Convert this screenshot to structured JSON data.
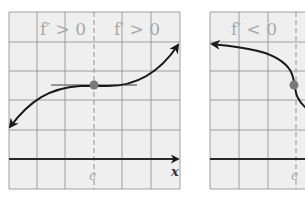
{
  "panels": [
    {
      "id": "left",
      "region_labels": [
        "f′ > 0",
        "f′ > 0"
      ],
      "tick_label": "c",
      "axis_label": "x",
      "curve": "increasing with horizontal tangent at c (inflection)",
      "point": "(c, f(c))"
    },
    {
      "id": "right",
      "region_labels": [
        "f′ < 0"
      ],
      "tick_label": "c",
      "curve": "decreasing with vertical tangent at c",
      "point": "(c, f(c))"
    }
  ],
  "colors": {
    "panel_bg": "#efefef",
    "grid": "#8a8a8a",
    "curve": "#1a1a1a",
    "label": "#a8a8a8",
    "point": "#7a7a7a",
    "tangent": "#777777"
  }
}
